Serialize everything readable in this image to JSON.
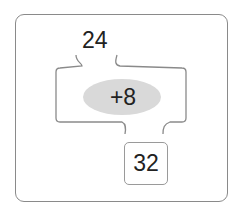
{
  "diagram": {
    "type": "function-machine",
    "input": "24",
    "operation": "+8",
    "output": "32",
    "colors": {
      "frame": "#8a8a8a",
      "machine_outline": "#8a8a8a",
      "operation_fill": "#d9d9d9",
      "text": "#222222"
    }
  }
}
